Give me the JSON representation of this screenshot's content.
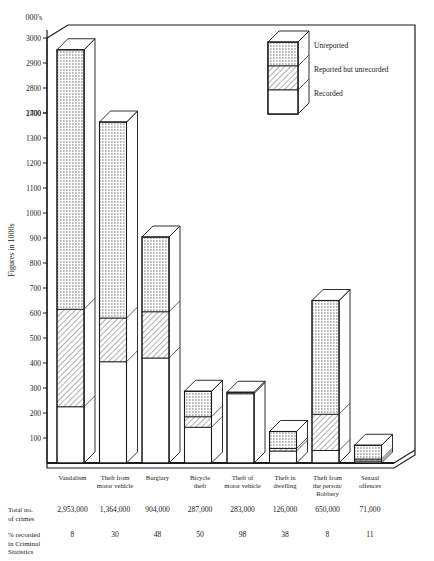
{
  "chart_data": {
    "type": "bar",
    "subtype": "stacked-3d-bar",
    "title": "",
    "unit_label": "000's",
    "ylabel": "Figures in 1000s",
    "xlabel": "",
    "grid": false,
    "legend_position": "top-right",
    "axis_note": "broken y-axis: 0-1400 then jump to 2700-3000",
    "yticks": [
      100,
      200,
      300,
      400,
      500,
      600,
      700,
      800,
      900,
      1000,
      1100,
      1200,
      1300,
      1400,
      2700,
      2800,
      2900,
      3000
    ],
    "ylim": [
      0,
      3000
    ],
    "categories": [
      "Vandalism",
      "Theft from motor vehicle",
      "Burglary",
      "Bicycle theft",
      "Theft of motor vehicle",
      "Theft in dwelling",
      "Theft from the person/ Robbery",
      "Sexual offences"
    ],
    "category_lines": [
      [
        "Vandalism"
      ],
      [
        "Theft from",
        "motor vehicle"
      ],
      [
        "Burglary"
      ],
      [
        "Bicycle",
        "theft"
      ],
      [
        "Theft of",
        "motor vehicle"
      ],
      [
        "Theft in",
        "dwelling"
      ],
      [
        "Theft from",
        "the person/",
        "Robbery"
      ],
      [
        "Sexual",
        "offences"
      ]
    ],
    "series": [
      {
        "name": "Recorded",
        "pattern": "blank",
        "values": [
          225,
          405,
          420,
          143,
          277,
          48,
          50,
          8
        ]
      },
      {
        "name": "Reported but unrecorded",
        "pattern": "hatched",
        "values": [
          390,
          175,
          185,
          42,
          6,
          10,
          145,
          8
        ]
      },
      {
        "name": "Unreported",
        "pattern": "dotted",
        "values": [
          2338,
          784,
          299,
          102,
          0,
          68,
          455,
          55
        ]
      }
    ],
    "totals": [
      2953,
      1364,
      904,
      287,
      283,
      126,
      650,
      71
    ]
  },
  "legend": {
    "items": [
      {
        "label": "Unreported",
        "pattern": "dotted"
      },
      {
        "label": "Reported but unrecorded",
        "pattern": "hatched"
      },
      {
        "label": "Recorded",
        "pattern": "blank"
      }
    ]
  },
  "table": {
    "row1_label_lines": [
      "Total no.",
      "of crimes"
    ],
    "row2_label_lines": [
      "% recorded",
      "in Criminal",
      "Statistics"
    ],
    "row1_values": [
      "2,953,000",
      "1,364,000",
      "904,000",
      "287,000",
      "283,000",
      "126,000",
      "650,000",
      "71,000"
    ],
    "row2_values": [
      "8",
      "30",
      "48",
      "50",
      "98",
      "38",
      "8",
      "11"
    ]
  },
  "colors": {
    "ink": "#1a1a1a",
    "background": "#ffffff",
    "fill_blank": "#ffffff",
    "fill_dotted": "#d9d9d9",
    "fill_hatched": "#e6e6e6"
  }
}
